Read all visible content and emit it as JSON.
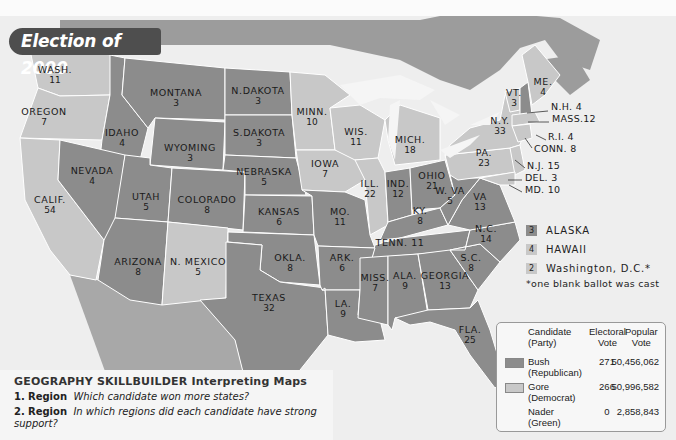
{
  "title": "Election of 2000",
  "colors": {
    "bush": "#8c8c8c",
    "gore": "#c8c8c8",
    "nader": "#f0f0f0",
    "ocean": "#eeeeee",
    "canada": "#9c9c9c",
    "border": "#ffffff"
  },
  "states": [
    {
      "name": "WASH.",
      "ev": "11",
      "party": "gore",
      "x": 55,
      "y": 70
    },
    {
      "name": "OREGON",
      "ev": "7",
      "party": "gore",
      "x": 44,
      "y": 112
    },
    {
      "name": "CALIF.",
      "ev": "54",
      "party": "gore",
      "x": 50,
      "y": 200
    },
    {
      "name": "IDAHO",
      "ev": "4",
      "party": "bush",
      "x": 122,
      "y": 133
    },
    {
      "name": "NEVADA",
      "ev": "4",
      "party": "bush",
      "x": 92,
      "y": 171
    },
    {
      "name": "MONTANA",
      "ev": "3",
      "party": "bush",
      "x": 176,
      "y": 93
    },
    {
      "name": "WYOMING",
      "ev": "3",
      "party": "bush",
      "x": 190,
      "y": 148
    },
    {
      "name": "UTAH",
      "ev": "5",
      "party": "bush",
      "x": 146,
      "y": 197
    },
    {
      "name": "COLORADO",
      "ev": "8",
      "party": "bush",
      "x": 207,
      "y": 200
    },
    {
      "name": "ARIZONA",
      "ev": "8",
      "party": "bush",
      "x": 138,
      "y": 262
    },
    {
      "name": "N. MEXICO",
      "ev": "5",
      "party": "gore",
      "x": 198,
      "y": 262
    },
    {
      "name": "N.DAKOTA",
      "ev": "3",
      "party": "bush",
      "x": 258,
      "y": 91
    },
    {
      "name": "S.DAKOTA",
      "ev": "3",
      "party": "bush",
      "x": 259,
      "y": 133
    },
    {
      "name": "NEBRASKA",
      "ev": "5",
      "party": "bush",
      "x": 264,
      "y": 172
    },
    {
      "name": "KANSAS",
      "ev": "6",
      "party": "bush",
      "x": 279,
      "y": 212
    },
    {
      "name": "OKLA.",
      "ev": "8",
      "party": "bush",
      "x": 290,
      "y": 258
    },
    {
      "name": "TEXAS",
      "ev": "32",
      "party": "bush",
      "x": 269,
      "y": 298
    },
    {
      "name": "MINN.",
      "ev": "10",
      "party": "gore",
      "x": 312,
      "y": 112
    },
    {
      "name": "IOWA",
      "ev": "7",
      "party": "gore",
      "x": 325,
      "y": 164
    },
    {
      "name": "MO.",
      "ev": "11",
      "party": "bush",
      "x": 340,
      "y": 212
    },
    {
      "name": "ARK.",
      "ev": "6",
      "party": "bush",
      "x": 342,
      "y": 258
    },
    {
      "name": "LA.",
      "ev": "9",
      "party": "bush",
      "x": 343,
      "y": 304
    },
    {
      "name": "WIS.",
      "ev": "11",
      "party": "gore",
      "x": 356,
      "y": 132
    },
    {
      "name": "ILL.",
      "ev": "22",
      "party": "gore",
      "x": 370,
      "y": 184
    },
    {
      "name": "MICH.",
      "ev": "18",
      "party": "gore",
      "x": 410,
      "y": 140
    },
    {
      "name": "IND.",
      "ev": "12",
      "party": "bush",
      "x": 398,
      "y": 184
    },
    {
      "name": "OHIO",
      "ev": "21",
      "party": "bush",
      "x": 432,
      "y": 176
    },
    {
      "name": "KY.",
      "ev": "8",
      "party": "bush",
      "x": 420,
      "y": 211
    },
    {
      "name": "TENN.",
      "ev": "11",
      "party": "bush",
      "x": 400,
      "y": 243,
      "inline": true
    },
    {
      "name": "MISS.",
      "ev": "7",
      "party": "bush",
      "x": 375,
      "y": 278
    },
    {
      "name": "ALA.",
      "ev": "9",
      "party": "bush",
      "x": 405,
      "y": 276
    },
    {
      "name": "GEORGIA",
      "ev": "13",
      "party": "bush",
      "x": 445,
      "y": 276
    },
    {
      "name": "FLA.",
      "ev": "25",
      "party": "bush",
      "x": 470,
      "y": 330
    },
    {
      "name": "S.C.",
      "ev": "8",
      "party": "bush",
      "x": 471,
      "y": 258
    },
    {
      "name": "N.C.",
      "ev": "14",
      "party": "bush",
      "x": 486,
      "y": 229
    },
    {
      "name": "VA",
      "ev": "13",
      "party": "bush",
      "x": 480,
      "y": 197
    },
    {
      "name": "W. VA",
      "ev": "5",
      "party": "bush",
      "x": 450,
      "y": 191
    },
    {
      "name": "PA.",
      "ev": "23",
      "party": "gore",
      "x": 484,
      "y": 153
    },
    {
      "name": "N.Y.",
      "ev": "33",
      "party": "gore",
      "x": 500,
      "y": 121
    },
    {
      "name": "VT.",
      "ev": "3",
      "party": "gore",
      "x": 514,
      "y": 93
    },
    {
      "name": "ME.",
      "ev": "4",
      "party": "gore",
      "x": 543,
      "y": 82
    }
  ],
  "northeast_labels": [
    {
      "text": "N.H. 4",
      "x": 551,
      "y": 107,
      "party": "bush"
    },
    {
      "text": "MASS.12",
      "x": 552,
      "y": 119,
      "party": "gore"
    },
    {
      "text": "R.I. 4",
      "x": 548,
      "y": 137,
      "party": "gore"
    },
    {
      "text": "CONN. 8",
      "x": 534,
      "y": 149,
      "party": "gore"
    },
    {
      "text": "N.J. 15",
      "x": 527,
      "y": 166,
      "party": "gore"
    },
    {
      "text": "DEL. 3",
      "x": 525,
      "y": 178,
      "party": "gore"
    },
    {
      "text": "MD. 10",
      "x": 525,
      "y": 190,
      "party": "gore"
    }
  ],
  "small_states": [
    {
      "ev": "3",
      "name": "ALASKA",
      "party": "bush"
    },
    {
      "ev": "4",
      "name": "HAWAII",
      "party": "gore"
    },
    {
      "ev": "2",
      "name": "Washington, D.C.*",
      "party": "gore"
    }
  ],
  "footnote": "*one blank ballot was cast",
  "legend": {
    "headers": {
      "candidate": "Candidate\n(Party)",
      "electoral": "Electoral\nVote",
      "popular": "Popular\nVote"
    },
    "rows": [
      {
        "name": "Bush",
        "party": "(Republican)",
        "electoral": "271",
        "popular": "50,456,062",
        "swatch": "bush"
      },
      {
        "name": "Gore",
        "party": "(Democrat)",
        "electoral": "266",
        "popular": "50,996,582",
        "swatch": "gore"
      },
      {
        "name": "Nader",
        "party": "(Green)",
        "electoral": "0",
        "popular": "2,858,843",
        "swatch": "none"
      }
    ]
  },
  "skillbuilder": {
    "title_bold": "GEOGRAPHY SKILLBUILDER",
    "title_sub": "Interpreting Maps",
    "questions": [
      {
        "num": "1.",
        "theme": "Region",
        "text": "Which candidate won more states?"
      },
      {
        "num": "2.",
        "theme": "Region",
        "text": "In which regions did each candidate have strong support?"
      }
    ]
  }
}
